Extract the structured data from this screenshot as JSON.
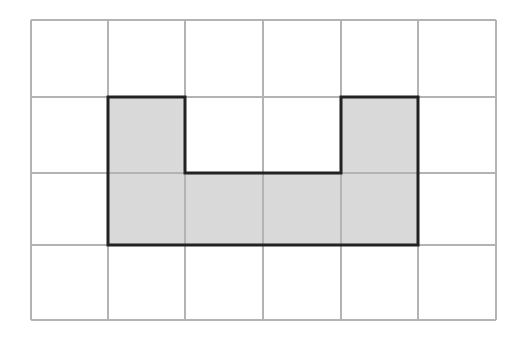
{
  "diagram": {
    "type": "grid-with-shaded-shape",
    "grid": {
      "columns": 6,
      "rows": 4,
      "line_color": "#b3b3b3"
    },
    "shape": {
      "description": "U-shaped shaded region",
      "fill_color": "#d9d9d9",
      "outline_color": "#222222",
      "cells": [
        [
          1,
          1
        ],
        [
          4,
          1
        ],
        [
          1,
          2
        ],
        [
          2,
          2
        ],
        [
          3,
          2
        ],
        [
          4,
          2
        ]
      ],
      "area_cells": 6
    }
  }
}
